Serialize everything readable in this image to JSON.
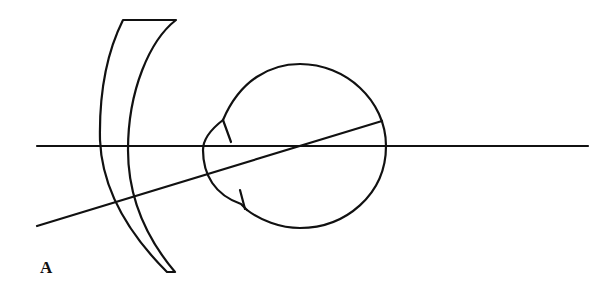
{
  "figure": {
    "panel_label": "A",
    "stroke_color": "#111111",
    "background": "#ffffff",
    "elements": [
      {
        "name": "spectacle-lens",
        "type": "meniscus-lens"
      },
      {
        "name": "eyeball",
        "type": "circle"
      },
      {
        "name": "cornea",
        "type": "arc"
      },
      {
        "name": "optical-axis",
        "type": "line"
      },
      {
        "name": "oblique-ray",
        "type": "line"
      }
    ]
  }
}
